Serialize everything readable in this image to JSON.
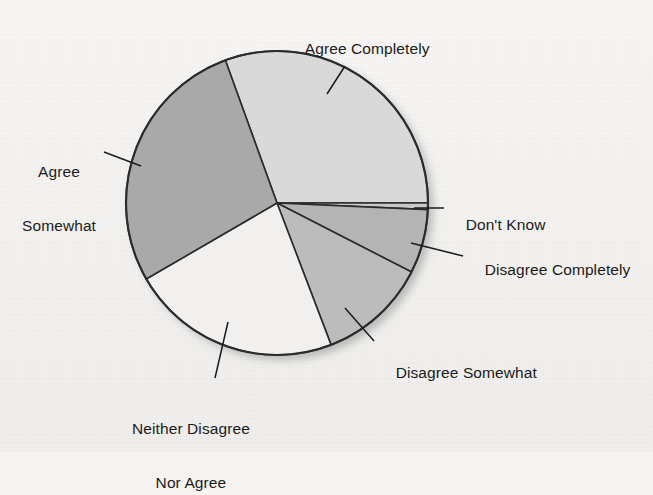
{
  "figure": {
    "background_color": "#f5f4f2",
    "outline_color": "#2b2b2b"
  },
  "chart_data": {
    "type": "pie",
    "title": "",
    "subtitle": "",
    "xlabel": "",
    "ylabel": "",
    "grid": false,
    "legend_position": "callout-labels",
    "labels_outside": true,
    "start_angle_deg": 110,
    "direction": "clockwise",
    "categories": [
      "Agree Completely",
      "Don't Know",
      "Disagree Completely",
      "Disagree Somewhat",
      "Neither Disagree Nor Agree",
      "Agree Somewhat"
    ],
    "values": [
      30.6,
      0.7,
      6.9,
      11.7,
      22.5,
      27.6
    ],
    "slices": [
      {
        "label": "Agree Completely",
        "label_lines": [
          "Agree Completely"
        ],
        "percent": 30.6,
        "start_deg": 110,
        "end_deg": 0,
        "color": "#d9d9d9",
        "label_x": 288,
        "label_y": 22,
        "leader": {
          "x1": 345,
          "y1": 66,
          "x2": 327,
          "y2": 94
        }
      },
      {
        "label": "Don't Know",
        "label_lines": [
          "Don't Know"
        ],
        "percent": 0.7,
        "start_deg": 0,
        "end_deg": -2.5,
        "color": "#c9c9c9",
        "label_x": 448,
        "label_y": 198,
        "leader": {
          "x1": 444,
          "y1": 208,
          "x2": 414,
          "y2": 208
        }
      },
      {
        "label": "Disagree Completely",
        "label_lines": [
          "Disagree Completely"
        ],
        "percent": 6.9,
        "start_deg": -2.5,
        "end_deg": -27,
        "color": "#b4b4b4",
        "label_x": 467,
        "label_y": 243,
        "leader": {
          "x1": 463,
          "y1": 256,
          "x2": 411,
          "y2": 243
        }
      },
      {
        "label": "Disagree Somewhat",
        "label_lines": [
          "Disagree Somewhat"
        ],
        "percent": 11.7,
        "start_deg": -27,
        "end_deg": -69,
        "color": "#bcbcbc",
        "label_x": 378,
        "label_y": 346,
        "leader": {
          "x1": 374,
          "y1": 341,
          "x2": 345,
          "y2": 308
        }
      },
      {
        "label": "Neither Disagree Nor Agree",
        "label_lines": [
          "Neither Disagree",
          "Nor Agree"
        ],
        "percent": 22.5,
        "start_deg": -69,
        "end_deg": -150,
        "color": "#f1f0ee",
        "label_x": 132,
        "label_y": 383,
        "leader": {
          "x1": 215,
          "y1": 378,
          "x2": 228,
          "y2": 322
        }
      },
      {
        "label": "Agree Somewhat",
        "label_lines": [
          "Agree",
          "Somewhat"
        ],
        "percent": 27.6,
        "start_deg": -150,
        "end_deg": 110,
        "color": "#a9a9a9",
        "label_x": 22,
        "label_y": 126,
        "leader": {
          "x1": 104,
          "y1": 152,
          "x2": 141,
          "y2": 166
        }
      }
    ],
    "geometry": {
      "center_x": 277,
      "center_y": 203,
      "radius_x": 151,
      "radius_y": 152
    }
  },
  "labels": {
    "agree_completely": "Agree Completely",
    "agree_somewhat_line1": "Agree",
    "agree_somewhat_line2": "Somewhat",
    "dont_know": "Don't Know",
    "disagree_completely": "Disagree Completely",
    "disagree_somewhat": "Disagree Somewhat",
    "neither_line1": "Neither Disagree",
    "neither_line2": "Nor Agree"
  }
}
